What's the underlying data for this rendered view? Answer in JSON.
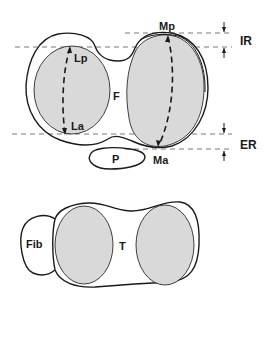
{
  "colors": {
    "line": "#1a1a1a",
    "facet_fill": "#d9d9d9",
    "dashed_line": "#555555",
    "background": "#ffffff"
  },
  "femur_view": {
    "bone_label": "F",
    "patella_label": "P",
    "lateral_condyle": {
      "posterior_label": "Lp",
      "anterior_label": "La"
    },
    "medial_condyle": {
      "posterior_label": "Mp",
      "anterior_label": "Ma"
    },
    "rotation_labels": {
      "internal": "IR",
      "external": "ER"
    }
  },
  "tibia_view": {
    "bone_label": "T",
    "fibula_label": "Fib"
  }
}
